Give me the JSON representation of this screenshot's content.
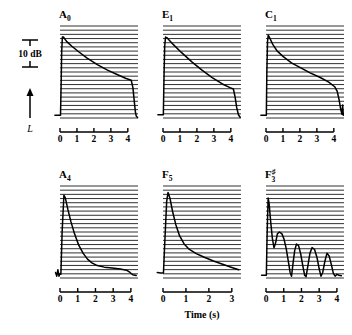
{
  "figure": {
    "axis_title": "Time (s)",
    "level_axis_label": "L",
    "scale_bar_label": "10 dB"
  },
  "chart_data": {
    "type": "line",
    "title": "",
    "xlabel": "Time (s)",
    "ylabel": "L",
    "grid": true,
    "legend": "none",
    "scale_bar": "10 dB",
    "panels": [
      {
        "label_base": "A",
        "label_sub": "0",
        "label_sup": "",
        "name": "A0",
        "row": 0,
        "col": 0,
        "xlim": [
          0,
          4.6
        ],
        "xticks": [
          0,
          1,
          2,
          3,
          4
        ],
        "xtick_labels": [
          "0",
          "1",
          "2",
          "3",
          "4"
        ],
        "description": "Sharp attack, slow near-linear decay, rapid release at key-off",
        "points": [
          [
            -0.3,
            0.03
          ],
          [
            0.03,
            0.03
          ],
          [
            0.07,
            0.4
          ],
          [
            0.1,
            0.72
          ],
          [
            0.14,
            0.88
          ],
          [
            0.2,
            0.88
          ],
          [
            0.4,
            0.83
          ],
          [
            0.7,
            0.78
          ],
          [
            1.1,
            0.72
          ],
          [
            1.6,
            0.65
          ],
          [
            2.2,
            0.58
          ],
          [
            2.8,
            0.52
          ],
          [
            3.4,
            0.47
          ],
          [
            3.9,
            0.43
          ],
          [
            4.2,
            0.41
          ],
          [
            4.3,
            0.33
          ],
          [
            4.38,
            0.18
          ],
          [
            4.45,
            0.06
          ],
          [
            4.5,
            0.02
          ],
          [
            4.58,
            0.005
          ]
        ]
      },
      {
        "label_base": "E",
        "label_sub": "1",
        "label_sup": "",
        "name": "E1",
        "row": 0,
        "col": 1,
        "xlim": [
          0,
          4.6
        ],
        "xticks": [
          0,
          1,
          2,
          3,
          4
        ],
        "xtick_labels": [
          "0",
          "1",
          "2",
          "3",
          "4"
        ],
        "description": "Sharp attack, steeper linear decay, rapid release at key-off",
        "points": [
          [
            -0.3,
            0.035
          ],
          [
            0.02,
            0.035
          ],
          [
            0.06,
            0.45
          ],
          [
            0.1,
            0.78
          ],
          [
            0.15,
            0.88
          ],
          [
            0.25,
            0.87
          ],
          [
            0.6,
            0.8
          ],
          [
            1.1,
            0.71
          ],
          [
            1.7,
            0.61
          ],
          [
            2.3,
            0.52
          ],
          [
            2.9,
            0.44
          ],
          [
            3.5,
            0.37
          ],
          [
            3.95,
            0.33
          ],
          [
            4.15,
            0.315
          ],
          [
            4.25,
            0.23
          ],
          [
            4.35,
            0.11
          ],
          [
            4.45,
            0.035
          ],
          [
            4.55,
            0.008
          ]
        ]
      },
      {
        "label_base": "C",
        "label_sub": "1",
        "label_sup": "",
        "name": "C1",
        "row": 0,
        "col": 2,
        "xlim": [
          0,
          4.6
        ],
        "xticks": [
          0,
          1,
          2,
          3,
          4
        ],
        "xtick_labels": [
          "0",
          "1",
          "2",
          "3",
          "4"
        ],
        "description": "Sharp attack, concave (double-slope) decay, rapid release",
        "points": [
          [
            -0.3,
            0.03
          ],
          [
            0.02,
            0.03
          ],
          [
            0.05,
            0.5
          ],
          [
            0.09,
            0.83
          ],
          [
            0.13,
            0.9
          ],
          [
            0.22,
            0.87
          ],
          [
            0.4,
            0.8
          ],
          [
            0.65,
            0.73
          ],
          [
            1.0,
            0.67
          ],
          [
            1.5,
            0.6
          ],
          [
            2.0,
            0.55
          ],
          [
            2.6,
            0.49
          ],
          [
            3.2,
            0.44
          ],
          [
            3.7,
            0.39
          ],
          [
            4.05,
            0.34
          ],
          [
            4.2,
            0.29
          ],
          [
            4.32,
            0.19
          ],
          [
            4.4,
            0.1
          ],
          [
            4.48,
            0.04
          ],
          [
            4.52,
            0.14
          ],
          [
            4.56,
            0.03
          ]
        ]
      },
      {
        "label_base": "A",
        "label_sub": "4",
        "label_sup": "",
        "name": "A4",
        "row": 1,
        "col": 0,
        "xlim": [
          0,
          4.4
        ],
        "xticks": [
          0,
          1,
          2,
          3,
          4
        ],
        "xtick_labels": [
          "0",
          "1",
          "2",
          "3",
          "4"
        ],
        "description": "Very sharp peak, fast exponential decay to a low plateau",
        "points": [
          [
            -0.25,
            0.06
          ],
          [
            -0.18,
            0.02
          ],
          [
            -0.12,
            0.09
          ],
          [
            -0.06,
            0.02
          ],
          [
            0.0,
            0.05
          ],
          [
            0.05,
            0.04
          ],
          [
            0.12,
            0.5
          ],
          [
            0.22,
            0.9
          ],
          [
            0.3,
            0.87
          ],
          [
            0.45,
            0.74
          ],
          [
            0.62,
            0.61
          ],
          [
            0.82,
            0.48
          ],
          [
            1.05,
            0.36
          ],
          [
            1.3,
            0.27
          ],
          [
            1.55,
            0.205
          ],
          [
            1.8,
            0.165
          ],
          [
            2.1,
            0.135
          ],
          [
            2.5,
            0.118
          ],
          [
            2.95,
            0.108
          ],
          [
            3.4,
            0.098
          ],
          [
            3.75,
            0.085
          ],
          [
            3.95,
            0.06
          ],
          [
            4.1,
            0.035
          ],
          [
            4.3,
            0.028
          ]
        ]
      },
      {
        "label_base": "F",
        "label_sub": "5",
        "label_sup": "",
        "name": "F5",
        "row": 1,
        "col": 1,
        "xlim": [
          0,
          3.4
        ],
        "xticks": [
          0,
          1,
          2,
          3
        ],
        "xtick_labels": [
          "0",
          "1",
          "2",
          "3"
        ],
        "description": "Very sharp peak, smooth exponential decay over full window",
        "points": [
          [
            -0.25,
            0.06
          ],
          [
            -0.1,
            0.055
          ],
          [
            0.02,
            0.055
          ],
          [
            0.08,
            0.4
          ],
          [
            0.16,
            0.83
          ],
          [
            0.22,
            0.93
          ],
          [
            0.3,
            0.87
          ],
          [
            0.42,
            0.72
          ],
          [
            0.56,
            0.58
          ],
          [
            0.72,
            0.46
          ],
          [
            0.92,
            0.37
          ],
          [
            1.15,
            0.31
          ],
          [
            1.45,
            0.265
          ],
          [
            1.8,
            0.225
          ],
          [
            2.2,
            0.185
          ],
          [
            2.6,
            0.15
          ],
          [
            3.0,
            0.115
          ],
          [
            3.3,
            0.09
          ]
        ]
      },
      {
        "label_base": "F",
        "label_sub": "3",
        "label_sup": "♯",
        "name": "F#3",
        "row": 1,
        "col": 2,
        "xlim": [
          0,
          4.4
        ],
        "xticks": [
          0,
          1,
          2,
          3,
          4
        ],
        "xtick_labels": [
          "0",
          "1",
          "2",
          "3",
          "4"
        ],
        "description": "Sharp peak followed by pronounced beating — repeated amplitude minima and maxima",
        "points": [
          [
            -0.25,
            0.03
          ],
          [
            0.02,
            0.03
          ],
          [
            0.06,
            0.45
          ],
          [
            0.12,
            0.87
          ],
          [
            0.18,
            0.8
          ],
          [
            0.26,
            0.62
          ],
          [
            0.36,
            0.43
          ],
          [
            0.45,
            0.33
          ],
          [
            0.54,
            0.38
          ],
          [
            0.64,
            0.48
          ],
          [
            0.76,
            0.5
          ],
          [
            0.9,
            0.48
          ],
          [
            1.02,
            0.42
          ],
          [
            1.14,
            0.32
          ],
          [
            1.26,
            0.18
          ],
          [
            1.36,
            0.06
          ],
          [
            1.44,
            0.02
          ],
          [
            1.52,
            0.15
          ],
          [
            1.62,
            0.3
          ],
          [
            1.72,
            0.37
          ],
          [
            1.84,
            0.35
          ],
          [
            1.96,
            0.26
          ],
          [
            2.08,
            0.13
          ],
          [
            2.18,
            0.03
          ],
          [
            2.26,
            0.015
          ],
          [
            2.36,
            0.13
          ],
          [
            2.48,
            0.27
          ],
          [
            2.6,
            0.33
          ],
          [
            2.74,
            0.31
          ],
          [
            2.88,
            0.22
          ],
          [
            3.0,
            0.1
          ],
          [
            3.1,
            0.02
          ],
          [
            3.2,
            0.06
          ],
          [
            3.32,
            0.18
          ],
          [
            3.44,
            0.27
          ],
          [
            3.56,
            0.24
          ],
          [
            3.68,
            0.15
          ],
          [
            3.8,
            0.05
          ],
          [
            3.9,
            0.02
          ],
          [
            4.0,
            0.04
          ],
          [
            4.12,
            0.03
          ],
          [
            4.25,
            0.025
          ]
        ]
      }
    ]
  }
}
